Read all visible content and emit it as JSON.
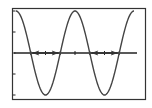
{
  "chart_data": {
    "type": "line",
    "title": "",
    "xlabel": "",
    "ylabel": "",
    "function": "cos",
    "series": [
      {
        "name": "y = cos(x)",
        "x": [
          0,
          0.5,
          1,
          1.5,
          2,
          2.5,
          3,
          3.5,
          4
        ],
        "values": [
          1,
          0,
          -1,
          0,
          1,
          0,
          -1,
          0,
          1
        ]
      }
    ],
    "x_unit": "half-periods",
    "xlim": [
      0,
      4
    ],
    "ylim": [
      -1.05,
      1.05
    ],
    "grid": false,
    "legend": "none",
    "y_ticks": [
      -1,
      -0.5,
      0,
      0.5,
      1
    ],
    "annotations": [
      {
        "type": "double-arrow",
        "between_x": [
          0.5,
          1.5
        ],
        "y": 0
      },
      {
        "type": "double-arrow",
        "between_x": [
          2.5,
          3.5
        ],
        "y": 0
      }
    ]
  },
  "colors": {
    "frame": "#333333",
    "curve": "#444444",
    "axis": "#222222",
    "arrow": "#333333",
    "background": "#ffffff"
  }
}
